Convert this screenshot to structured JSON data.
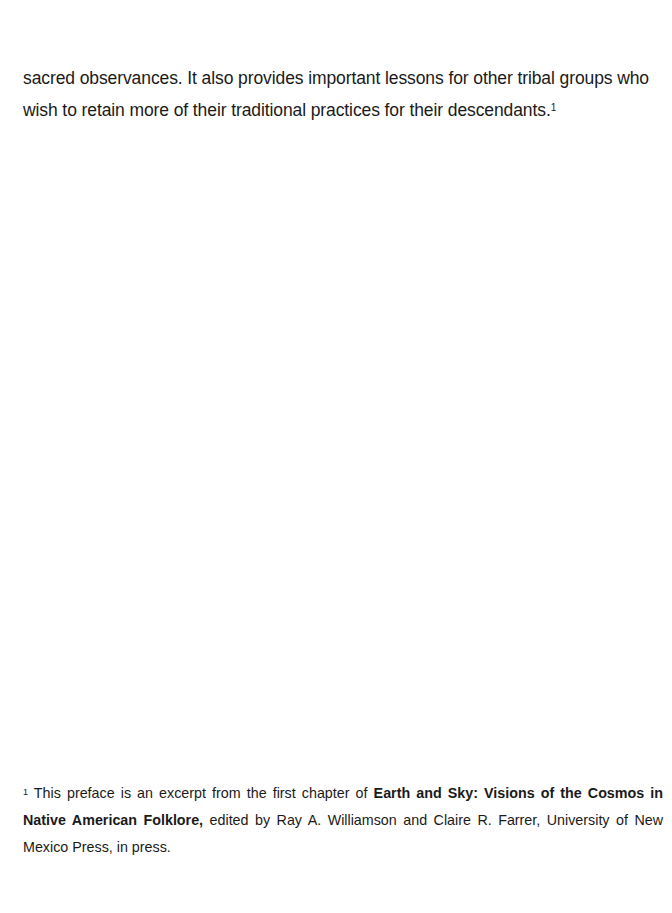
{
  "body": {
    "line1": "sacred observances. It also provides important lessons for other tribal groups who",
    "line2": "wish to retain more of their traditional practices for their descendants.",
    "footnote_ref": "1"
  },
  "footnote": {
    "marker": "1",
    "intro": " This preface is an excerpt from the first chapter of ",
    "book_title": "Earth and Sky: Visions of the Cosmos in Native American Folklore,",
    "rest": " edited by Ray A. Williamson and Claire R. Farrer, University of New Mexico Press, in press."
  }
}
